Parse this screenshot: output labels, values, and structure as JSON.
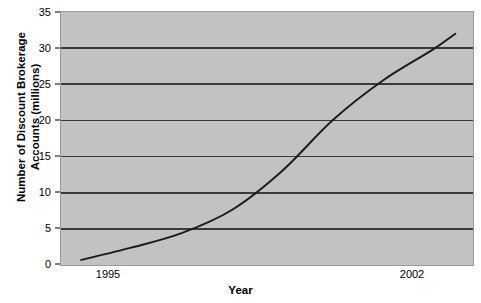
{
  "chart_data": {
    "type": "line",
    "title": "",
    "subtitle": "",
    "xlabel": "Year",
    "ylabel": "Number of Discount Brokerage Accounts (millions)",
    "ylabel_lines": [
      "Number of Discount Brokerage",
      "Accounts (millions)"
    ],
    "xlim": [
      1994.6,
      2002.8
    ],
    "ylim": [
      0,
      35
    ],
    "yticks": [
      0,
      5,
      10,
      15,
      20,
      25,
      30,
      35
    ],
    "ytick_labels": [
      "0",
      "5",
      "10",
      "15",
      "20",
      "25",
      "30",
      "35"
    ],
    "xticks": [
      1995,
      2002
    ],
    "xtick_labels": [
      "1995",
      "2002"
    ],
    "grid": "horizontal",
    "legend": "none",
    "series": [
      {
        "name": "Discount brokerage accounts",
        "x": [
          1995,
          1996,
          1997,
          1998,
          1999,
          2000,
          2001,
          2002
        ],
        "values": [
          0.7,
          2.4,
          4.4,
          7.6,
          13.0,
          20.0,
          25.5,
          29.8
        ]
      }
    ],
    "line_end_x": 2002.45,
    "line_end_value": 32.0,
    "colors": {
      "plot_background": "#c2c2c2",
      "gridline": "#3a3a3a",
      "line": "#1a1a1a",
      "axis": "#000000",
      "plot_border": "#9a9a9a",
      "page_background": "#ffffff",
      "text": "#000000"
    }
  }
}
